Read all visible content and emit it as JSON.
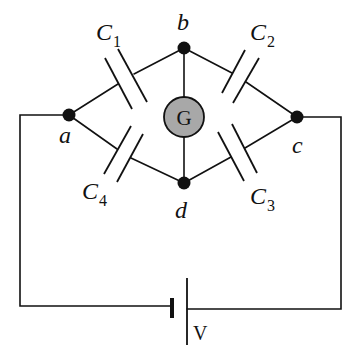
{
  "diagram": {
    "type": "capacitor bridge circuit",
    "nodes": [
      {
        "id": "a",
        "label": "a"
      },
      {
        "id": "b",
        "label": "b"
      },
      {
        "id": "c",
        "label": "c"
      },
      {
        "id": "d",
        "label": "d"
      }
    ],
    "capacitors": [
      {
        "id": "C1",
        "letter": "C",
        "sub": "1",
        "between": [
          "a",
          "b"
        ]
      },
      {
        "id": "C2",
        "letter": "C",
        "sub": "2",
        "between": [
          "b",
          "c"
        ]
      },
      {
        "id": "C3",
        "letter": "C",
        "sub": "3",
        "between": [
          "d",
          "c"
        ]
      },
      {
        "id": "C4",
        "letter": "C",
        "sub": "4",
        "between": [
          "a",
          "d"
        ]
      }
    ],
    "galvanometer": {
      "label": "G",
      "between": [
        "b",
        "d"
      ],
      "fill": "#a8a8a8"
    },
    "battery": {
      "label": "V",
      "between": [
        "a",
        "c"
      ]
    }
  }
}
